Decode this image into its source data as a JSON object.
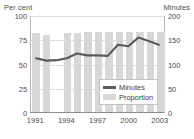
{
  "axes": {
    "left_unit": "Per cent",
    "right_unit": "Minutes",
    "left_ticks": [
      "100",
      "75",
      "50",
      "25",
      "0"
    ],
    "right_ticks": [
      "200",
      "150",
      "100",
      "50",
      "0"
    ],
    "x_ticks": [
      "1991",
      "1994",
      "1997",
      "2000",
      "2003"
    ]
  },
  "legend": {
    "minutes_label": "Minutes",
    "proportion_label": "Proportion"
  },
  "colors": {
    "bar": "#d7d7d7",
    "line": "#5a5a5a",
    "grid": "#dcdcdc",
    "axis": "#8c8c8c",
    "text": "#4a4a4a"
  },
  "chart_data": {
    "type": "bar",
    "title": "",
    "subtitle": "",
    "xlabel": "",
    "ylabel": "Per cent",
    "y2label": "Minutes",
    "ylim": [
      0,
      100
    ],
    "y2lim": [
      0,
      200
    ],
    "grid": true,
    "legend_position": "inside-bottom-right",
    "x": [
      "1991",
      "1992",
      "1993",
      "1994",
      "1995",
      "1996",
      "1997",
      "1998",
      "1999",
      "2000",
      "2001",
      "2002",
      "2003"
    ],
    "categories": [
      "1991",
      "1992",
      "1993",
      "1994",
      "1995",
      "1996",
      "1997",
      "1998",
      "1999",
      "2000",
      "2001",
      "2002",
      "2003"
    ],
    "series": [
      {
        "name": "Proportion",
        "type": "bar",
        "axis": "left",
        "unit": "Per cent",
        "values": [
          81,
          79,
          null,
          81,
          81,
          82,
          82,
          82,
          82,
          82,
          82,
          82,
          83
        ]
      },
      {
        "name": "Minutes",
        "type": "line",
        "axis": "right",
        "unit": "Minutes",
        "values": [
          112,
          107,
          108,
          112,
          122,
          118,
          118,
          117,
          140,
          137,
          155,
          148,
          140
        ]
      }
    ]
  }
}
